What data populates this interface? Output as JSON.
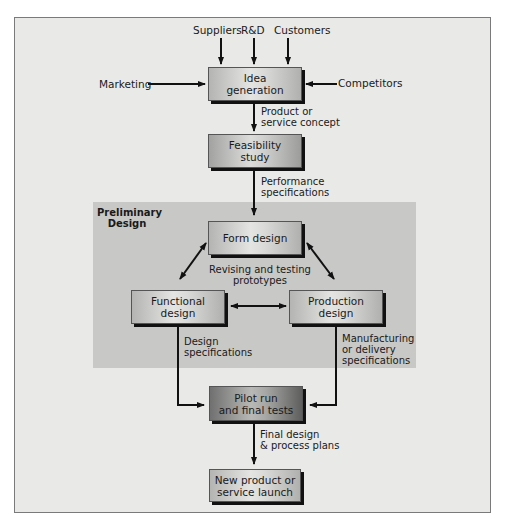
{
  "diagram": {
    "inputs": {
      "top": [
        "Suppliers",
        "R&D",
        "Customers"
      ],
      "left": "Marketing",
      "right": "Competitors"
    },
    "nodes": {
      "idea": [
        "Idea",
        "generation"
      ],
      "feasibility": [
        "Feasibility",
        "study"
      ],
      "form": [
        "Form design"
      ],
      "functional": [
        "Functional",
        "design"
      ],
      "production": [
        "Production",
        "design"
      ],
      "pilot": [
        "Pilot run",
        "and final tests"
      ],
      "launch": [
        "New product or",
        "service launch"
      ]
    },
    "region": {
      "title": [
        "Preliminary",
        "Design"
      ]
    },
    "edge_labels": {
      "concept": [
        "Product or",
        "service concept"
      ],
      "performance": [
        "Performance",
        "specifications"
      ],
      "revising": [
        "Revising and testing",
        "prototypes"
      ],
      "design_specs": [
        "Design",
        "specifications"
      ],
      "mfg_specs": [
        "Manufacturing",
        "or delivery",
        "specifications"
      ],
      "final": [
        "Final design",
        "& process plans"
      ]
    }
  }
}
